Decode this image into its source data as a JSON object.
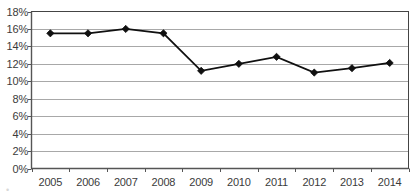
{
  "chart_data": {
    "type": "line",
    "title": "",
    "subtitle": "",
    "xlabel": "",
    "ylabel": "",
    "categories": [
      "2005",
      "2006",
      "2007",
      "2008",
      "2009",
      "2010",
      "2011",
      "2012",
      "2013",
      "2014"
    ],
    "x": [
      2005,
      2006,
      2007,
      2008,
      2009,
      2010,
      2011,
      2012,
      2013,
      2014
    ],
    "values": [
      15.5,
      15.5,
      16.0,
      15.5,
      11.2,
      12.0,
      12.8,
      11.0,
      11.5,
      12.1
    ],
    "series": [
      {
        "name": "",
        "values": [
          15.5,
          15.5,
          16.0,
          15.5,
          11.2,
          12.0,
          12.8,
          11.0,
          11.5,
          12.1
        ]
      }
    ],
    "ylim": [
      0,
      18
    ],
    "ytick_values": [
      0,
      2,
      4,
      6,
      8,
      10,
      12,
      14,
      16,
      18
    ],
    "ytick_labels": [
      "0%",
      "2%",
      "4%",
      "6%",
      "8%",
      "10%",
      "12%",
      "14%",
      "16%",
      "18%"
    ],
    "xtick_labels": [
      "2005",
      "2006",
      "2007",
      "2008",
      "2009",
      "2010",
      "2011",
      "2012",
      "2013",
      "2014"
    ],
    "grid": true,
    "grid_axis": "y",
    "legend": false,
    "legend_position": "none",
    "marker": "diamond",
    "annotations": []
  },
  "style": {
    "line_color": "#101010",
    "marker_color": "#101010",
    "grid_color": "#a8a8a8",
    "axis_color": "#555555",
    "plot_border_color": "#444444",
    "plot_background": "#ffffff",
    "tick_label_color": "#3b3b3b"
  },
  "artifacts": {
    "bottom_left_smudge": "•"
  }
}
